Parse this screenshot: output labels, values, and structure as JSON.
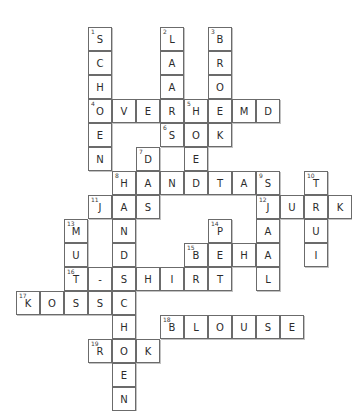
{
  "puzzle": {
    "title": "Kleding kruiswoordpuzzel",
    "grid": {
      "cell_size": 24,
      "origin_x": 16,
      "origin_y": 27,
      "columns": 13,
      "rows": 14
    },
    "colors": {
      "cell_border": "#6b6b6b",
      "cell_background": "#ffffff",
      "letter": "#2b2b2b",
      "number": "#3a3a3a",
      "page_background": "#ffffff"
    },
    "entries": [
      {
        "number": 1,
        "answer": "SCHOEN",
        "direction": "down",
        "row": 0,
        "col": 3
      },
      {
        "number": 2,
        "answer": "LAARS",
        "direction": "down",
        "row": 0,
        "col": 6
      },
      {
        "number": 3,
        "answer": "BROEK",
        "direction": "down",
        "row": 0,
        "col": 8
      },
      {
        "number": 4,
        "answer": "OVERHEMD",
        "direction": "across",
        "row": 3,
        "col": 3
      },
      {
        "number": 5,
        "answer": "HOED",
        "direction": "down",
        "row": 3,
        "col": 7
      },
      {
        "number": 6,
        "answer": "SOK",
        "direction": "across",
        "row": 4,
        "col": 6
      },
      {
        "number": 7,
        "answer": "DAS",
        "direction": "down",
        "row": 5,
        "col": 5
      },
      {
        "number": 8,
        "answer": "HANDTAS",
        "direction": "across",
        "row": 6,
        "col": 4
      },
      {
        "number": 8,
        "answer": "HANDSCHOEN",
        "direction": "down",
        "row": 6,
        "col": 4
      },
      {
        "number": 9,
        "answer": "SJAAL",
        "direction": "down",
        "row": 6,
        "col": 10
      },
      {
        "number": 10,
        "answer": "TRUI",
        "direction": "down",
        "row": 6,
        "col": 12
      },
      {
        "number": 11,
        "answer": "JAS",
        "direction": "across",
        "row": 7,
        "col": 3
      },
      {
        "number": 12,
        "answer": "JURK",
        "direction": "across",
        "row": 7,
        "col": 10
      },
      {
        "number": 13,
        "answer": "MUTS",
        "direction": "down",
        "row": 8,
        "col": 2
      },
      {
        "number": 14,
        "answer": "PET",
        "direction": "down",
        "row": 8,
        "col": 8
      },
      {
        "number": 15,
        "answer": "BEHA",
        "direction": "across",
        "row": 9,
        "col": 7
      },
      {
        "number": 16,
        "answer": "T-SHIRT",
        "direction": "across",
        "row": 10,
        "col": 2
      },
      {
        "number": 17,
        "answer": "KOUS",
        "direction": "across",
        "row": 11,
        "col": 0
      },
      {
        "number": 18,
        "answer": "BLOUSE",
        "direction": "across",
        "row": 12,
        "col": 6
      },
      {
        "number": 19,
        "answer": "ROK",
        "direction": "across",
        "row": 13,
        "col": 3
      }
    ]
  }
}
